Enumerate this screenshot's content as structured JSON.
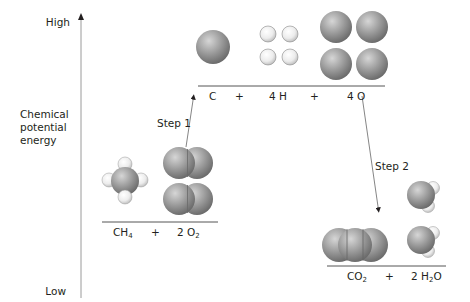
{
  "axis": {
    "high": "High",
    "low": "Low",
    "title_lines": [
      "Chemical",
      "potential",
      "energy"
    ]
  },
  "steps": {
    "step1": "Step 1",
    "step2": "Step 2"
  },
  "levels": {
    "reactants": {
      "term1": {
        "base": "CH",
        "sub": "4"
      },
      "plus": "+",
      "term2": {
        "coef": "2 O",
        "sub": "2"
      }
    },
    "atoms": {
      "term1": "C",
      "plus1": "+",
      "term2": "4 H",
      "plus2": "+",
      "term3": "4 O"
    },
    "products": {
      "term1": {
        "base": "CO",
        "sub": "2"
      },
      "plus": "+",
      "term2": {
        "pre": "2 H",
        "sub": "2",
        "post": "O"
      }
    }
  },
  "colors": {
    "sphere_gray": "#8c8c8c",
    "sphere_light": "#f2f2f2",
    "line": "#555555"
  }
}
